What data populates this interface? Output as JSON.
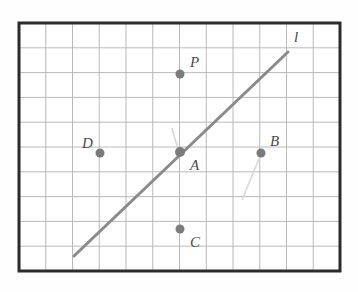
{
  "figure": {
    "kind": "geometry-grid-diagram",
    "colors": {
      "background": "#fefefe",
      "paper": "#ffffff",
      "border": "#2b2b2b",
      "grid": "#b9b9b9",
      "line": "#8a8a8a",
      "point": "#7b7b7b",
      "label": "#4a4a4a",
      "faint_curve": "#d8d8d8"
    },
    "frame": {
      "x": 19,
      "y": 23,
      "width": 321,
      "height": 248,
      "border_width": 3
    },
    "grid": {
      "cell_width": 26.75,
      "cell_height": 24.8,
      "columns": 12,
      "rows": 10,
      "visible": true,
      "stroke_width": 1
    },
    "line": {
      "name": "l",
      "label": "l",
      "label_x": 294,
      "label_y": 42,
      "x1": 74,
      "y1": 256,
      "x2": 288,
      "y2": 52,
      "stroke_width": 3
    },
    "points": [
      {
        "label": "P",
        "cx": 180,
        "cy": 74,
        "lx": 190,
        "ly": 67,
        "r": 4.5,
        "on_line": false
      },
      {
        "label": "D",
        "cx": 100,
        "cy": 153,
        "lx": 82,
        "ly": 148,
        "r": 4.5,
        "on_line": false
      },
      {
        "label": "A",
        "cx": 180,
        "cy": 152,
        "lx": 190,
        "ly": 170,
        "r": 5.0,
        "on_line": true
      },
      {
        "label": "B",
        "cx": 261,
        "cy": 153,
        "lx": 270,
        "ly": 146,
        "r": 4.5,
        "on_line": false
      },
      {
        "label": "C",
        "cx": 180,
        "cy": 229,
        "lx": 190,
        "ly": 247,
        "r": 4.5,
        "on_line": false
      }
    ],
    "faint_marks": [
      {
        "name": "curve-near-b",
        "d": "M 242 200 C 248 186, 254 170, 260 157"
      },
      {
        "name": "curve-near-a",
        "d": "M 172 128 C 174 136, 176 143, 179 150"
      }
    ]
  }
}
